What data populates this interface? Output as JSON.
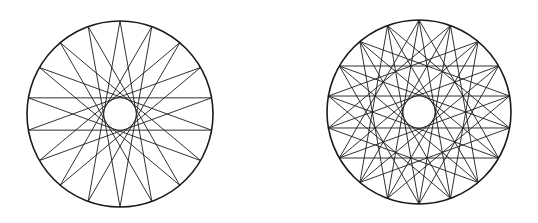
{
  "canvas": {
    "width": 538,
    "height": 223,
    "background": "#ffffff"
  },
  "stroke": {
    "color": "#1a1a1a",
    "outer_width": 1.6,
    "chord_width": 0.9
  },
  "figures": [
    {
      "name": "star-polygon-18-8",
      "description": "18 equally spaced points on a circle, each joined to the point 8 steps away",
      "cx": 120,
      "cy": 114,
      "r": 93,
      "points": 18,
      "start_angle_deg": -90,
      "steps": [
        8
      ]
    },
    {
      "name": "star-polygon-18-6-and-18-8",
      "description": "18 equally spaced points on a circle, each joined to the points 6 and 8 steps away",
      "cx": 419,
      "cy": 112,
      "r": 92,
      "points": 18,
      "start_angle_deg": -90,
      "steps": [
        6,
        8
      ]
    }
  ]
}
